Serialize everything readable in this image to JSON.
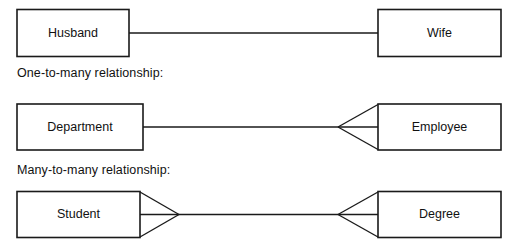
{
  "diagram": {
    "line_color": "#1a1a1a",
    "fill_color": "#ffffff",
    "text_color": "#111111"
  },
  "captions": {
    "one_to_many": "One-to-many relationship:",
    "many_to_many": "Many-to-many relationship:"
  },
  "rows": [
    {
      "id": "one-to-one",
      "cardinality": "one-to-one",
      "left_entity": "Husband",
      "right_entity": "Wife",
      "left_crowfoot": false,
      "right_crowfoot": false
    },
    {
      "id": "one-to-many",
      "cardinality": "one-to-many",
      "left_entity": "Department",
      "right_entity": "Employee",
      "left_crowfoot": false,
      "right_crowfoot": true
    },
    {
      "id": "many-to-many",
      "cardinality": "many-to-many",
      "left_entity": "Student",
      "right_entity": "Degree",
      "left_crowfoot": true,
      "right_crowfoot": true
    }
  ]
}
